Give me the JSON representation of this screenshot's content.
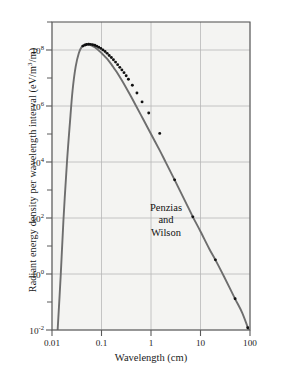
{
  "chart_data": {
    "type": "line",
    "title": "",
    "xlabel": "Wavelength (cm)",
    "ylabel": "Radiant energy density per wavelength interval (eV/m",
    "ylabel_sup": "3",
    "ylabel_tail": "/m)",
    "ylabel_full": "Radiant energy density per wavelength interval (eV/m3/m)",
    "xscale": "log",
    "yscale": "log",
    "xlim": [
      0.01,
      100
    ],
    "ylim": [
      0.01,
      1000000000
    ],
    "grid": true,
    "legend": null,
    "xticks": [
      {
        "value": 0.01,
        "label": "0.01"
      },
      {
        "value": 0.1,
        "label": "0.1"
      },
      {
        "value": 1,
        "label": "1"
      },
      {
        "value": 10,
        "label": "10"
      },
      {
        "value": 100,
        "label": "100"
      }
    ],
    "yticks": [
      {
        "value": 100000000,
        "mantissa": "10",
        "exponent": "8"
      },
      {
        "value": 1000000,
        "mantissa": "10",
        "exponent": "6"
      },
      {
        "value": 10000,
        "mantissa": "10",
        "exponent": "4"
      },
      {
        "value": 100,
        "mantissa": "10",
        "exponent": "2"
      },
      {
        "value": 1,
        "mantissa": "10",
        "exponent": "0"
      },
      {
        "value": 0.01,
        "mantissa": "10",
        "exponent": "-2"
      }
    ],
    "y_minor_ticks": [
      1000000000,
      10000000,
      100000,
      1000,
      10,
      0.1
    ],
    "series": [
      {
        "name": "blackbody-curve",
        "style": "solid-gray-line",
        "color": "#6e6e6e",
        "x": [
          0.013,
          0.015,
          0.017,
          0.02,
          0.023,
          0.026,
          0.03,
          0.035,
          0.04,
          0.045,
          0.05,
          0.06,
          0.07,
          0.08,
          0.09,
          0.1,
          0.11,
          0.12,
          0.14,
          0.16,
          0.18,
          0.2,
          0.25,
          0.3,
          0.4,
          0.5,
          0.7,
          1.0,
          1.5,
          2.0,
          3.0,
          5.0,
          7.0,
          10.0,
          15.0,
          20.0,
          30.0,
          50.0,
          70.0,
          100.0
        ],
        "y": [
          0.01,
          0.9,
          80.0,
          9000.0,
          250000.0,
          3500000.0,
          25000000.0,
          80000000.0,
          130000000.0,
          155000000.0,
          160000000.0,
          150000000.0,
          130000000.0,
          110000000.0,
          92000000.0,
          78000000.0,
          66000000.0,
          56000000.0,
          41000000.0,
          30000000.0,
          22000000.0,
          17000000.0,
          9000000.0,
          5200000.0,
          2100000.0,
          1000000.0,
          330000.0,
          100000.0,
          26000.0,
          9500.0,
          2300.0,
          370.0,
          110.0,
          33.0,
          8.0,
          3.2,
          0.8,
          0.13,
          0.04,
          0.0075
        ]
      },
      {
        "name": "measured-data-points",
        "style": "black-dots",
        "color": "#111111",
        "x": [
          0.042,
          0.046,
          0.05,
          0.055,
          0.06,
          0.066,
          0.073,
          0.08,
          0.088,
          0.097,
          0.107,
          0.118,
          0.13,
          0.143,
          0.158,
          0.174,
          0.192,
          0.212,
          0.234,
          0.258,
          0.285,
          0.315,
          0.35,
          0.42,
          0.52,
          0.66,
          0.9,
          1.5,
          3.0,
          7.0,
          20.0,
          50.0,
          90.0
        ],
        "y": [
          138000000.0,
          149000000.0,
          157000000.0,
          160000000.0,
          159000000.0,
          155000000.0,
          147000000.0,
          137000000.0,
          126000000.0,
          114000000.0,
          101000000.0,
          88000000.0,
          76000000.0,
          64000000.0,
          54000000.0,
          45000000.0,
          37000000.0,
          30000000.0,
          24000000.0,
          19500000.0,
          15500000.0,
          12000000.0,
          9000000.0,
          5500000.0,
          2900000.0,
          1400000.0,
          560000.0,
          105000.0,
          2300.0,
          110.0,
          3.2,
          0.13,
          0.012
        ]
      }
    ],
    "annotations": [
      {
        "name": "penzias-wilson-label",
        "lines": [
          "Penzias",
          "and",
          "Wilson"
        ],
        "x_px": 166,
        "y_px": 221
      }
    ]
  },
  "figure": {
    "background": "#ffffff",
    "plot_background": "#f4f4f2",
    "frame_color": "#5a5a5a",
    "grid_color": "#b8b8b8",
    "curve_color": "#6e6e6e",
    "dot_color": "#111111"
  }
}
